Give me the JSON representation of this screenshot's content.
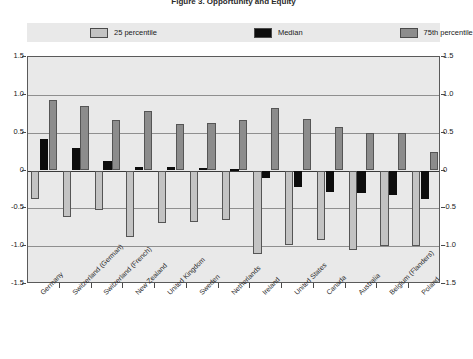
{
  "chart": {
    "title": "Figure 3. Opportunity and Equity",
    "type": "bar"
  },
  "legend": {
    "position": "top",
    "entries": [
      {
        "label": "25 percentile",
        "color": "#c3c3c3",
        "name": "p25"
      },
      {
        "label": "Median",
        "color": "#0d0d0d",
        "name": "median"
      },
      {
        "label": "75th percentile",
        "color": "#8c8c8c",
        "name": "p75"
      }
    ]
  },
  "yaxis": {
    "ticks": [
      "1.5",
      "1.0",
      "0.5",
      "0",
      "-0.5",
      "-1.0",
      "-1.5"
    ],
    "tick_values": [
      1.5,
      1.0,
      0.5,
      0,
      -0.5,
      -1.0,
      -1.5
    ],
    "min": -1.5,
    "max": 1.5,
    "label": ""
  },
  "chart_data": {
    "type": "bar",
    "title": "Figure 3. Opportunity and Equity",
    "xlabel": "",
    "ylabel": "",
    "ylim": [
      -1.5,
      1.5
    ],
    "grid": true,
    "legend_position": "top",
    "categories": [
      "Germany",
      "Switzerland (German)",
      "Switzerland (French)",
      "New Zealand",
      "United Kingdom",
      "Sweden",
      "Netherlands",
      "Ireland",
      "United States",
      "Canada",
      "Australia",
      "Belgium (Flanders)",
      "Poland"
    ],
    "series": [
      {
        "name": "25 percentile",
        "color": "#c3c3c3",
        "values": [
          -0.38,
          -0.62,
          -0.52,
          -0.88,
          -0.7,
          -0.68,
          -0.66,
          -1.1,
          -0.98,
          -0.92,
          -1.05,
          -1.0,
          -1.0
        ]
      },
      {
        "name": "Median",
        "color": "#0d0d0d",
        "values": [
          0.42,
          0.3,
          0.13,
          0.04,
          0.04,
          0.03,
          0.02,
          -0.1,
          -0.22,
          -0.28,
          -0.3,
          -0.32,
          -0.38
        ]
      },
      {
        "name": "75th percentile",
        "color": "#8c8c8c",
        "values": [
          0.93,
          0.85,
          0.67,
          0.78,
          0.62,
          0.63,
          0.67,
          0.82,
          0.68,
          0.58,
          0.5,
          0.5,
          0.24
        ]
      }
    ]
  }
}
